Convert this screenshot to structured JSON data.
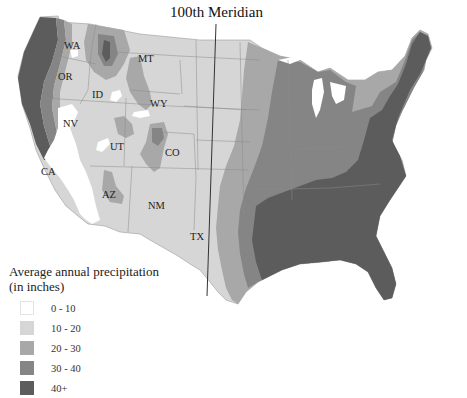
{
  "map": {
    "title": "100th Meridian",
    "region": "Contiguous United States",
    "colors": {
      "0-10": "#ffffff",
      "10-20": "#d6d6d6",
      "20-30": "#a8a8a8",
      "30-40": "#858585",
      "40+": "#5c5c5c",
      "border": "#8a8a8a",
      "meridian_line": "#333333"
    },
    "state_labels": [
      {
        "id": "WA",
        "text": "WA"
      },
      {
        "id": "OR",
        "text": "OR"
      },
      {
        "id": "ID",
        "text": "ID"
      },
      {
        "id": "MT",
        "text": "MT"
      },
      {
        "id": "WY",
        "text": "WY"
      },
      {
        "id": "NV",
        "text": "NV"
      },
      {
        "id": "UT",
        "text": "UT"
      },
      {
        "id": "CO",
        "text": "CO"
      },
      {
        "id": "CA",
        "text": "CA"
      },
      {
        "id": "AZ",
        "text": "AZ"
      },
      {
        "id": "NM",
        "text": "NM"
      },
      {
        "id": "TX",
        "text": "TX"
      }
    ]
  },
  "legend": {
    "title_line1": "Average annual precipitation",
    "title_line2": "(in inches)",
    "items": [
      {
        "label": "0 - 10",
        "color": "#ffffff"
      },
      {
        "label": "10 - 20",
        "color": "#d6d6d6"
      },
      {
        "label": "20 - 30",
        "color": "#a8a8a8"
      },
      {
        "label": "30 - 40",
        "color": "#858585"
      },
      {
        "label": "40+",
        "color": "#5c5c5c"
      }
    ]
  }
}
